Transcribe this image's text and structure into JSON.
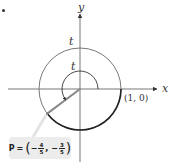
{
  "diagram": {
    "axes": {
      "x_label": "x",
      "y_label": "y"
    },
    "labels": {
      "outer_arc_t": "t",
      "inner_arc_t": "t",
      "start_point": "(1, 0)"
    },
    "point": {
      "name": "P",
      "equals": "=",
      "x_sign": "−",
      "x_num": "4",
      "x_den": "5",
      "comma": ",",
      "y_sign": "−",
      "y_num": "3",
      "y_den": "5",
      "open_paren": "(",
      "close_paren": ")"
    },
    "colors": {
      "circle": "#7a7a7a",
      "highlight_arc": "#222222",
      "radius_segment": "#8a8a8a",
      "axes": "#555555",
      "label_box": "#ececec"
    }
  }
}
